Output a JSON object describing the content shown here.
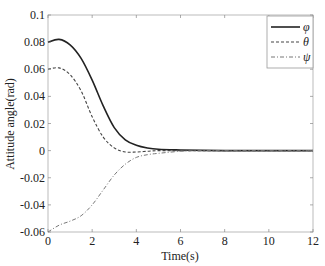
{
  "chart_data": {
    "type": "line",
    "title": "",
    "xlabel": "Time(s)",
    "ylabel": "Attitude angle(rad)",
    "xlim": [
      0,
      12
    ],
    "ylim": [
      -0.06,
      0.1
    ],
    "xticks": [
      0,
      2,
      4,
      6,
      8,
      10,
      12
    ],
    "yticks": [
      0.1,
      0.08,
      0.06,
      0.04,
      0.02,
      0,
      -0.02,
      -0.04,
      -0.06
    ],
    "ytick_labels": [
      "0.1",
      "0.08",
      "0.06",
      "0.04",
      "0.02",
      "0",
      "-0.02",
      "-0.04",
      "-0.06"
    ],
    "xtick_labels": [
      "0",
      "2",
      "4",
      "6",
      "8",
      "10",
      "12"
    ],
    "grid": false,
    "legend_position": "upper right",
    "x": [
      0,
      0.5,
      1,
      1.5,
      2,
      2.5,
      3,
      3.5,
      4,
      4.5,
      5,
      6,
      7,
      8,
      9,
      10,
      11,
      12
    ],
    "series": [
      {
        "name": "φ",
        "style": "solid",
        "values": [
          0.08,
          0.082,
          0.078,
          0.068,
          0.052,
          0.033,
          0.017,
          0.008,
          0.004,
          0.002,
          0.001,
          0.0005,
          0.0002,
          0,
          0,
          0,
          0,
          0
        ]
      },
      {
        "name": "θ",
        "style": "dashed",
        "values": [
          0.06,
          0.061,
          0.056,
          0.044,
          0.025,
          0.01,
          0.002,
          -0.001,
          -0.001,
          -0.0005,
          0,
          0,
          0,
          0,
          0,
          0,
          0,
          0
        ]
      },
      {
        "name": "ψ",
        "style": "dashdot",
        "values": [
          -0.06,
          -0.055,
          -0.052,
          -0.048,
          -0.04,
          -0.029,
          -0.018,
          -0.01,
          -0.005,
          -0.003,
          -0.002,
          -0.0005,
          0,
          0,
          0,
          0,
          0,
          0
        ]
      }
    ]
  },
  "legend": {
    "items": [
      "φ",
      "θ",
      "ψ"
    ]
  },
  "axes": {
    "xlabel": "Time(s)",
    "ylabel": "Attitude angle(rad)"
  }
}
